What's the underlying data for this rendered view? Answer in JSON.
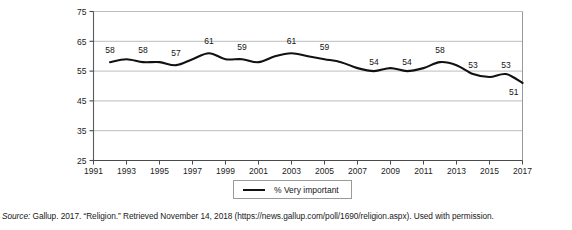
{
  "figure": {
    "top_clipped_text": "",
    "source_prefix": "Source:",
    "source_text": " Gallup. 2017. “Religion.” Retrieved November 14, 2018 (https://news.gallup.com/poll/1690/religion.aspx). Used with permission."
  },
  "legend": {
    "position": "bottom-center",
    "entries": [
      {
        "label": "% Very important",
        "color": "#111111",
        "marker": "line"
      }
    ]
  },
  "chart_data": {
    "type": "line",
    "title": "",
    "subtitle": "",
    "xlabel": "",
    "ylabel": "",
    "grid": true,
    "legend_position": "bottom-center",
    "xlim": [
      1991,
      2017
    ],
    "ylim": [
      25,
      75
    ],
    "ytick_values": [
      25,
      35,
      45,
      55,
      65,
      75
    ],
    "ytick_labels": [
      "25",
      "35",
      "45",
      "55",
      "65",
      "75"
    ],
    "xtick_values": [
      1991,
      1993,
      1995,
      1997,
      1999,
      2001,
      2003,
      2005,
      2007,
      2009,
      2011,
      2013,
      2015,
      2017
    ],
    "xtick_labels": [
      "1991",
      "1993",
      "1995",
      "1997",
      "1999",
      "2001",
      "2003",
      "2005",
      "2007",
      "2009",
      "2011",
      "2013",
      "2015",
      "2017"
    ],
    "series": [
      {
        "name": "% Very important",
        "color": "#111111",
        "x": [
          1992,
          1993,
          1994,
          1995,
          1996,
          1997,
          1998,
          1999,
          2000,
          2001,
          2002,
          2003,
          2004,
          2005,
          2006,
          2007,
          2008,
          2009,
          2010,
          2011,
          2012,
          2013,
          2014,
          2015,
          2016,
          2017
        ],
        "values": [
          58,
          59,
          58,
          58,
          57,
          59,
          61,
          59,
          59,
          58,
          60,
          61,
          60,
          59,
          58,
          56,
          55,
          56,
          55,
          56,
          58,
          57,
          54,
          53,
          54,
          51
        ]
      }
    ],
    "point_labels": [
      {
        "year": 1992,
        "value": 58,
        "text": "58"
      },
      {
        "year": 1994,
        "value": 58,
        "text": "58"
      },
      {
        "year": 1996,
        "value": 57,
        "text": "57"
      },
      {
        "year": 1998,
        "value": 61,
        "text": "61"
      },
      {
        "year": 2000,
        "value": 59,
        "text": "59"
      },
      {
        "year": 2003,
        "value": 61,
        "text": "61"
      },
      {
        "year": 2005,
        "value": 59,
        "text": "59"
      },
      {
        "year": 2008,
        "value": 54,
        "text": "54"
      },
      {
        "year": 2010,
        "value": 54,
        "text": "54"
      },
      {
        "year": 2012,
        "value": 58,
        "text": "58"
      },
      {
        "year": 2014,
        "value": 53,
        "text": "53"
      },
      {
        "year": 2016,
        "value": 53,
        "text": "53"
      },
      {
        "year": 2017,
        "value": 51,
        "text": "51"
      }
    ]
  }
}
